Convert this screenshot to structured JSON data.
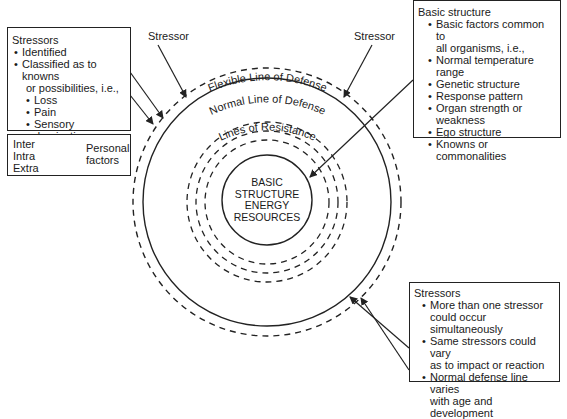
{
  "center": {
    "lines": [
      "BASIC",
      "STRUCTURE",
      "ENERGY",
      "RESOURCES"
    ]
  },
  "rings": {
    "flexible": "Flexible Line of Defense",
    "normal": "Normal Line of Defense",
    "resistance": "Lines of Resistance"
  },
  "stressor_labels": [
    "Stressor",
    "Stressor"
  ],
  "stressors_box_left": {
    "title": "Stressors",
    "items": [
      "Identified",
      "Classified as to knowns",
      "or possibilities, i.e.,"
    ],
    "sub_items": [
      "Loss",
      "Pain",
      "Sensory deprivation",
      "Cultural change"
    ]
  },
  "personal_factors_box": {
    "factors": [
      "Inter",
      "Intra",
      "Extra"
    ],
    "label_line1": "Personal",
    "label_line2": "factors"
  },
  "basic_structure_box": {
    "title": "Basic structure",
    "items": [
      "Basic factors common to",
      "all organisms, i.e.,",
      "Normal temperature",
      "range",
      "Genetic structure",
      "Response pattern",
      "Organ strength or",
      "weakness",
      "Ego structure",
      "Knowns or commonalities"
    ]
  },
  "stressors_box_right": {
    "title": "Stressors",
    "items": [
      "More than one stressor",
      "could occur",
      "simultaneously",
      "Same stressors could vary",
      "as to impact or reaction",
      "Normal defense line varies",
      "with age and development"
    ]
  }
}
